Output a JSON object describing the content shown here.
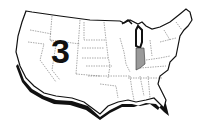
{
  "map": {
    "title": "United States map",
    "region_label": "3",
    "highlighted_state": "Indiana",
    "colors": {
      "background": "#ffffff",
      "land": "#ffffff",
      "outline": "#111111",
      "state_border": "#555555",
      "highlight": "#9a9a9a",
      "shadow": "#111111"
    }
  }
}
